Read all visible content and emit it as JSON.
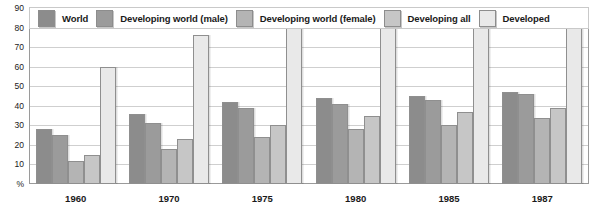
{
  "chart_data": {
    "type": "bar",
    "title": "",
    "xlabel": "",
    "ylabel": "%",
    "ylim": [
      0,
      90
    ],
    "yticks": [
      0,
      10,
      20,
      30,
      40,
      50,
      60,
      70,
      80,
      90
    ],
    "ytick_labels": [
      "%",
      "10",
      "20",
      "30",
      "40",
      "50",
      "60",
      "70",
      "80",
      "90"
    ],
    "grid": true,
    "legend_position": "top",
    "categories": [
      "1960",
      "1970",
      "1975",
      "1980",
      "1985",
      "1987"
    ],
    "series": [
      {
        "name": "World",
        "color": "#8c8c8c",
        "values": [
          28,
          36,
          42,
          44,
          45,
          47
        ]
      },
      {
        "name": "Developing world (male)",
        "color": "#9b9b9b",
        "values": [
          25,
          31,
          39,
          41,
          43,
          46
        ]
      },
      {
        "name": "Developing world (female)",
        "color": "#b4b4b4",
        "values": [
          12,
          18,
          24,
          28,
          30,
          34
        ]
      },
      {
        "name": "Developing all",
        "color": "#c6c6c6",
        "values": [
          15,
          23,
          30,
          35,
          37,
          39
        ]
      },
      {
        "name": "Developed",
        "color": "#e9e9e9",
        "values": [
          60,
          76,
          85,
          85,
          89,
          90
        ]
      }
    ]
  },
  "legend": {
    "items": [
      {
        "label": "World"
      },
      {
        "label": "Developing world (male)"
      },
      {
        "label": "Developing world (female)"
      },
      {
        "label": "Developing all"
      },
      {
        "label": "Developed"
      }
    ]
  },
  "axis": {
    "y_unit_label": "%"
  },
  "title_strip": ""
}
